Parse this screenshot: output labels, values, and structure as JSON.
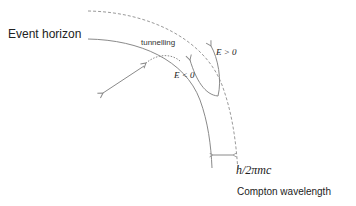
{
  "diagram": {
    "labels": {
      "event_horizon": "Event horizon",
      "tunnelling": "tunnelling",
      "energy_negative": "E < 0",
      "energy_positive": "E > 0",
      "compton_formula": "h/2πmc",
      "compton_wavelength": "Compton wavelength"
    },
    "colors": {
      "line": "#8a8a8a",
      "text": "#222222"
    }
  }
}
